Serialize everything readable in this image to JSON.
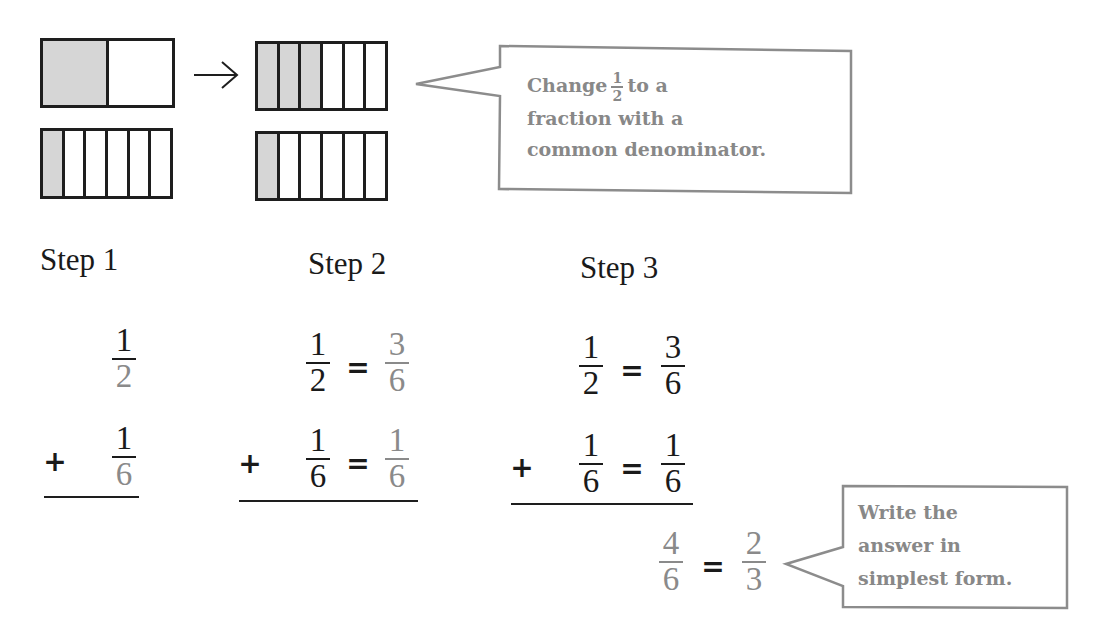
{
  "models": {
    "before_top": {
      "parts": 2,
      "shaded": 1,
      "represents": "1/2"
    },
    "before_bottom": {
      "parts": 6,
      "shaded": 1,
      "represents": "1/6"
    },
    "after_top": {
      "parts": 6,
      "shaded": 3,
      "represents": "3/6"
    },
    "after_bottom": {
      "parts": 6,
      "shaded": 1,
      "represents": "1/6"
    },
    "arrow": "→"
  },
  "callouts": {
    "common_denominator": {
      "line1_pre": "Change",
      "frac_num": "1",
      "frac_den": "2",
      "line1_post": "to a",
      "line2": "fraction with a",
      "line3": "common denominator."
    },
    "simplest_form": {
      "line1": "Write the",
      "line2": "answer in",
      "line3": "simplest form."
    }
  },
  "steps": [
    {
      "label": "Step 1",
      "plus": "+",
      "rows": [
        {
          "num": "1",
          "den": "2"
        },
        {
          "num": "1",
          "den": "6"
        }
      ]
    },
    {
      "label": "Step 2",
      "plus": "+",
      "equals": "=",
      "rows": [
        {
          "num": "1",
          "den": "2",
          "eq_num": "3",
          "eq_den": "6"
        },
        {
          "num": "1",
          "den": "6",
          "eq_num": "1",
          "eq_den": "6"
        }
      ]
    },
    {
      "label": "Step 3",
      "plus": "+",
      "equals": "=",
      "rows": [
        {
          "num": "1",
          "den": "2",
          "eq_num": "3",
          "eq_den": "6"
        },
        {
          "num": "1",
          "den": "6",
          "eq_num": "1",
          "eq_den": "6"
        }
      ],
      "sum": {
        "num": "4",
        "den": "6",
        "equals": "=",
        "simple_num": "2",
        "simple_den": "3"
      }
    }
  ],
  "colors": {
    "ink": "#1a1a1a",
    "highlight_gray": "#8a8a8a",
    "shade": "#d6d6d6",
    "callout_border": "#8c8c8c"
  }
}
